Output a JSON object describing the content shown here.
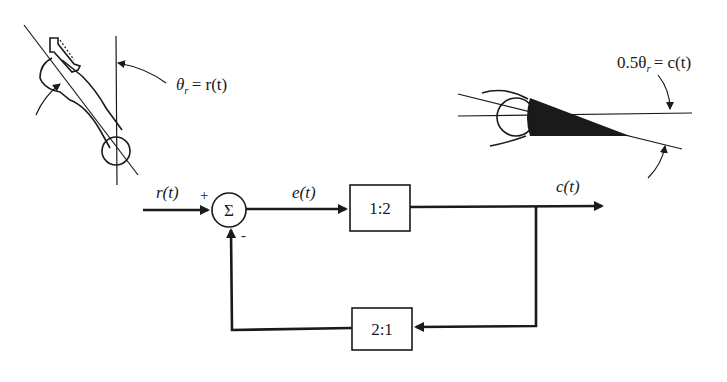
{
  "diagram": {
    "type": "feedback-control-block-diagram",
    "input_figure": {
      "description": "Input arm rotated by angle from vertical",
      "angle_label": "θr = r(t)",
      "angle_symbol": "θ",
      "angle_subscript": "r",
      "angle_rhs": "= r(t)"
    },
    "output_figure": {
      "description": "Output pointer rotated from horizontal",
      "angle_label": "0.5θr = c(t)",
      "angle_prefix": "0.5θ",
      "angle_subscript": "r",
      "angle_rhs": "= c(t)"
    },
    "signals": {
      "input": "r(t)",
      "error": "e(t)",
      "output": "c(t)"
    },
    "summing_junction": {
      "symbol": "Σ",
      "plus_sign": "+",
      "minus_sign": "-"
    },
    "blocks": {
      "forward": {
        "label": "1:2"
      },
      "feedback": {
        "label": "2:1"
      }
    },
    "colors": {
      "ink": "#1a1a1a",
      "background": "#ffffff"
    }
  }
}
